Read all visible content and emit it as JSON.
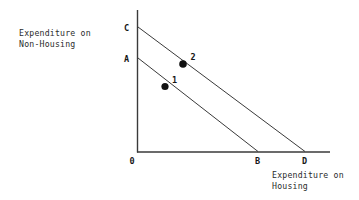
{
  "diagram": {
    "title_y": "Expenditure on\nNon-Housing",
    "title_x": "Expenditure on\nHousing",
    "axis_origin_label": "0",
    "line_color": "#3a3a3a",
    "point_color": "#111111",
    "text_color": "#2b2b2b",
    "background": "#ffffff"
  },
  "chart_data": {
    "type": "line",
    "title": "",
    "xlabel": "Expenditure on Housing",
    "ylabel": "Expenditure on Non-Housing",
    "grid": false,
    "legend": "none",
    "xlim": [
      0,
      100
    ],
    "ylim": [
      0,
      100
    ],
    "series": [
      {
        "name": "Budget line AB",
        "endpoints": [
          {
            "label": "A",
            "x": 0,
            "y": 66
          },
          {
            "label": "B",
            "x": 63,
            "y": 0
          }
        ]
      },
      {
        "name": "Budget line CD",
        "endpoints": [
          {
            "label": "C",
            "x": 0,
            "y": 88
          },
          {
            "label": "D",
            "x": 88,
            "y": 0
          }
        ]
      }
    ],
    "points": [
      {
        "label": "1",
        "x": 15,
        "y": 46,
        "on": "Budget line AB"
      },
      {
        "label": "2",
        "x": 24,
        "y": 63,
        "on": "Budget line CD"
      }
    ],
    "axis_labels": [
      "0",
      "A",
      "B",
      "C",
      "D"
    ]
  },
  "labels": {
    "origin": "0",
    "a": "A",
    "b": "B",
    "c": "C",
    "d": "D",
    "point1": "1",
    "point2": "2"
  }
}
